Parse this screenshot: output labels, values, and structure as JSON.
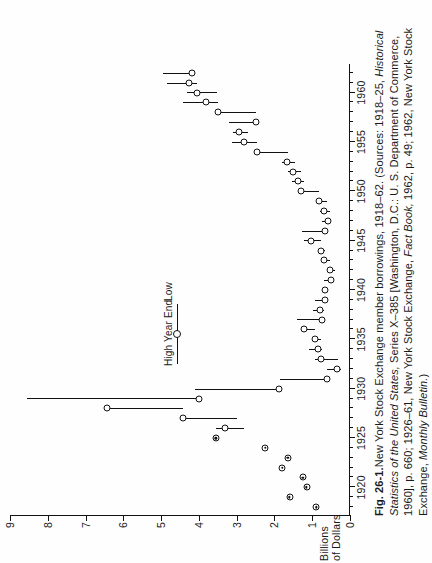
{
  "figure": {
    "label": "Fig. 26-1.",
    "title_text": "New York Stock Exchange member borrowings, 1918–62. (Sources: 1918–25, ",
    "sources_italic_1": "Historical Statistics of the United States,",
    "sources_mid": " Series X–385 [Washington, D.C.: U. S. Department of Commerce, 1960], p. 660; 1926–61, New York Stock Exchange, ",
    "sources_italic_2": "Fact Book,",
    "sources_tail": " 1962, p. 49; 1962, New York Stock Exchange, ",
    "sources_italic_3": "Monthly Bulletin.",
    "sources_close": ")"
  },
  "legend": {
    "high_label": "High",
    "year_end_label": "Year End",
    "low_label": "Low",
    "marker": "open-circle-with-whisker"
  },
  "chart_data": {
    "type": "bar",
    "title": "New York Stock Exchange member borrowings, 1918–62",
    "xlabel": "",
    "ylabel": "Billions\nof Dollars",
    "ylabel_lines": [
      "Billions",
      "of Dollars"
    ],
    "xlim": [
      1917.2,
      1963.0
    ],
    "ylim": [
      0,
      9
    ],
    "yticks": [
      0,
      1,
      2,
      3,
      4,
      5,
      6,
      7,
      8,
      9
    ],
    "ytick_labels": [
      "0",
      "1",
      "2",
      "3",
      "4",
      "5",
      "6",
      "7",
      "8",
      "9"
    ],
    "xticks": [
      1920,
      1925,
      1930,
      1935,
      1940,
      1945,
      1950,
      1955,
      1960
    ],
    "xtick_labels": [
      "1920",
      "1925",
      "1930",
      "1935",
      "1940",
      "1945",
      "1950",
      "1955",
      "1960"
    ],
    "xticks_minor": [
      1918,
      1919,
      1921,
      1922,
      1923,
      1924,
      1926,
      1927,
      1928,
      1929,
      1931,
      1932,
      1933,
      1934,
      1936,
      1937,
      1938,
      1939,
      1941,
      1942,
      1943,
      1944,
      1946,
      1947,
      1948,
      1949,
      1951,
      1952,
      1953,
      1954,
      1956,
      1957,
      1958,
      1959,
      1961,
      1962
    ],
    "grid": false,
    "legend_position": "upper-left-inside",
    "series": [
      {
        "name": "High",
        "note": "upper end of vertical range bar"
      },
      {
        "name": "Year End",
        "note": "open circle marker"
      },
      {
        "name": "Low",
        "note": "lower end of vertical range bar"
      }
    ],
    "points": [
      {
        "year": 1918,
        "year_end": 0.9,
        "high": null,
        "low": null
      },
      {
        "year": 1919,
        "year_end": 1.6,
        "high": null,
        "low": null
      },
      {
        "year": 1920,
        "year_end": 1.15,
        "high": null,
        "low": null
      },
      {
        "year": 1921,
        "year_end": 1.25,
        "high": null,
        "low": null
      },
      {
        "year": 1922,
        "year_end": 1.8,
        "high": null,
        "low": null
      },
      {
        "year": 1923,
        "year_end": 1.65,
        "high": null,
        "low": null
      },
      {
        "year": 1924,
        "year_end": 2.25,
        "high": null,
        "low": null
      },
      {
        "year": 1925,
        "year_end": 3.55,
        "high": null,
        "low": null
      },
      {
        "year": 1926,
        "year_end": 3.3,
        "high": 3.55,
        "low": 2.8
      },
      {
        "year": 1927,
        "year_end": 4.43,
        "high": 4.43,
        "low": 3.0
      },
      {
        "year": 1928,
        "year_end": 6.44,
        "high": 6.44,
        "low": 4.42
      },
      {
        "year": 1929,
        "year_end": 3.99,
        "high": 8.55,
        "low": 3.99
      },
      {
        "year": 1930,
        "year_end": 1.89,
        "high": 4.11,
        "low": 1.89
      },
      {
        "year": 1931,
        "year_end": 0.6,
        "high": 1.85,
        "low": 0.6
      },
      {
        "year": 1932,
        "year_end": 0.35,
        "high": 0.6,
        "low": 0.24
      },
      {
        "year": 1933,
        "year_end": 0.78,
        "high": 0.92,
        "low": 0.33
      },
      {
        "year": 1934,
        "year_end": 0.84,
        "high": 1.08,
        "low": 0.74
      },
      {
        "year": 1935,
        "year_end": 0.93,
        "high": 0.99,
        "low": 0.76
      },
      {
        "year": 1936,
        "year_end": 1.22,
        "high": 1.25,
        "low": 0.93
      },
      {
        "year": 1937,
        "year_end": 0.75,
        "high": 1.4,
        "low": 0.73
      },
      {
        "year": 1938,
        "year_end": 0.8,
        "high": 0.99,
        "low": 0.68
      },
      {
        "year": 1939,
        "year_end": 0.65,
        "high": 0.92,
        "low": 0.62
      },
      {
        "year": 1940,
        "year_end": 0.67,
        "high": 0.7,
        "low": 0.57
      },
      {
        "year": 1941,
        "year_end": 0.51,
        "high": 0.69,
        "low": 0.49
      },
      {
        "year": 1942,
        "year_end": 0.52,
        "high": 0.55,
        "low": 0.41
      },
      {
        "year": 1943,
        "year_end": 0.68,
        "high": 0.75,
        "low": 0.52
      },
      {
        "year": 1944,
        "year_end": 0.78,
        "high": 0.8,
        "low": 0.66
      },
      {
        "year": 1945,
        "year_end": 1.04,
        "high": 1.22,
        "low": 0.78
      },
      {
        "year": 1946,
        "year_end": 0.66,
        "high": 1.27,
        "low": 0.58
      },
      {
        "year": 1947,
        "year_end": 0.57,
        "high": 0.73,
        "low": 0.55
      },
      {
        "year": 1948,
        "year_end": 0.69,
        "high": 0.79,
        "low": 0.54
      },
      {
        "year": 1949,
        "year_end": 0.82,
        "high": 0.85,
        "low": 0.62
      },
      {
        "year": 1950,
        "year_end": 1.29,
        "high": 1.35,
        "low": 0.82
      },
      {
        "year": 1951,
        "year_end": 1.37,
        "high": 1.53,
        "low": 1.22
      },
      {
        "year": 1952,
        "year_end": 1.51,
        "high": 1.65,
        "low": 1.3
      },
      {
        "year": 1953,
        "year_end": 1.67,
        "high": 1.8,
        "low": 1.46
      },
      {
        "year": 1954,
        "year_end": 2.45,
        "high": 2.48,
        "low": 1.65
      },
      {
        "year": 1955,
        "year_end": 2.8,
        "high": 3.13,
        "low": 2.45
      },
      {
        "year": 1956,
        "year_end": 2.94,
        "high": 3.11,
        "low": 2.7
      },
      {
        "year": 1957,
        "year_end": 2.48,
        "high": 3.19,
        "low": 2.44
      },
      {
        "year": 1958,
        "year_end": 3.5,
        "high": 3.57,
        "low": 2.48
      },
      {
        "year": 1959,
        "year_end": 3.8,
        "high": 4.43,
        "low": 3.5
      },
      {
        "year": 1960,
        "year_end": 4.05,
        "high": 4.31,
        "low": 3.53
      },
      {
        "year": 1961,
        "year_end": 4.26,
        "high": 4.85,
        "low": 4.05
      },
      {
        "year": 1962,
        "year_end": 4.18,
        "high": 4.95,
        "low": 4.16
      }
    ]
  }
}
